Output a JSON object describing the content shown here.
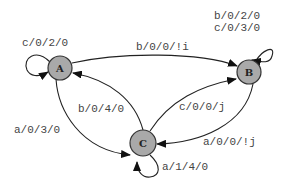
{
  "diagram": {
    "type": "state-machine",
    "nodes": [
      {
        "id": "A",
        "label": "A"
      },
      {
        "id": "B",
        "label": "B"
      },
      {
        "id": "C",
        "label": "C"
      }
    ],
    "edges": [
      {
        "from": "A",
        "to": "A",
        "label": "c/0/2/0"
      },
      {
        "from": "A",
        "to": "B",
        "label": "b/0/0/!i"
      },
      {
        "from": "A",
        "to": "C",
        "label": "a/0/3/0"
      },
      {
        "from": "C",
        "to": "A",
        "label": "b/0/4/0"
      },
      {
        "from": "C",
        "to": "B",
        "label": "c/0/0/j"
      },
      {
        "from": "B",
        "to": "C",
        "label": "a/0/0/!j"
      },
      {
        "from": "C",
        "to": "C",
        "label": "a/1/4/0"
      },
      {
        "from": "B",
        "to": "B",
        "label_line1": "b/0/2/0",
        "label_line2": "c/0/3/0"
      }
    ]
  },
  "colors": {
    "node_fill": "#a9a9a9",
    "stroke": "#222222",
    "background": "#ffffff"
  }
}
